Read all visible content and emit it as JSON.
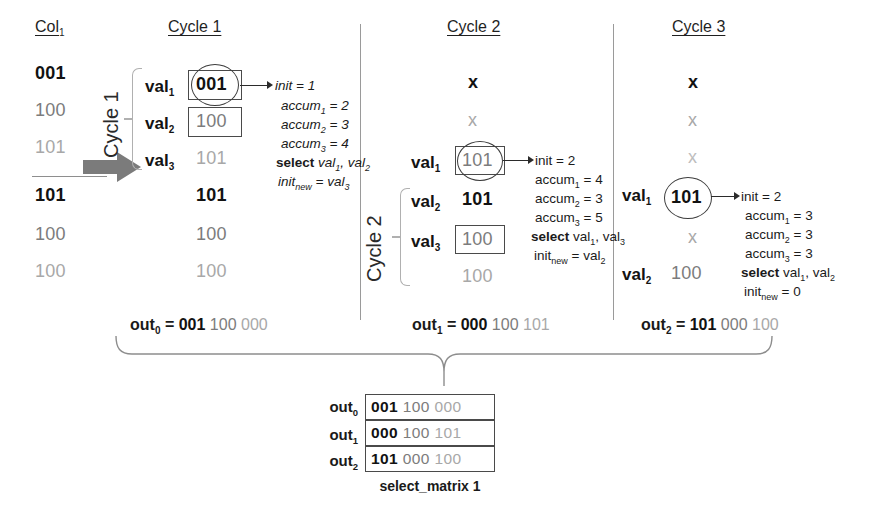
{
  "headers": {
    "col": "Col",
    "col_sub": "1",
    "cycle1": "Cycle 1",
    "cycle2": "Cycle 2",
    "cycle3": "Cycle 3"
  },
  "col1": {
    "values": [
      "001",
      "100",
      "101",
      "101",
      "100",
      "100"
    ],
    "arrow_label": "Cycle 1"
  },
  "cycle1": {
    "bracket_label": "Cycle 1",
    "rows": [
      {
        "label": "val",
        "sub": "1",
        "value": "001",
        "boxed": true,
        "circled": true
      },
      {
        "label": "val",
        "sub": "2",
        "value": "100",
        "boxed": true,
        "circled": false
      },
      {
        "label": "val",
        "sub": "3",
        "value": "101",
        "boxed": false,
        "circled": false
      }
    ],
    "tail": [
      "101",
      "100",
      "100"
    ],
    "annotations": {
      "init": "init = 1",
      "accum1": "accum",
      "accum1_sub": "1",
      "accum1_val": " = 2",
      "accum2": "accum",
      "accum2_sub": "2",
      "accum2_val": " = 3",
      "accum3": "accum",
      "accum3_sub": "3",
      "accum3_val": " = 4",
      "select_kw": "select",
      "select_args": "val",
      "select_sub1": "1",
      "select_mid": ", val",
      "select_sub2": "2",
      "initnew": "init",
      "initnew_sub": "new",
      "initnew_val": " = val",
      "initnew_valsub": "3"
    }
  },
  "cycle2": {
    "bracket_label": "Cycle 2",
    "top_marks": [
      "x",
      "x"
    ],
    "rows": [
      {
        "label": "val",
        "sub": "1",
        "value": "101",
        "boxed": true,
        "circled": true
      },
      {
        "label": "val",
        "sub": "2",
        "value": "101",
        "boxed": false,
        "circled": false
      },
      {
        "label": "val",
        "sub": "3",
        "value": "100",
        "boxed": true,
        "circled": false
      }
    ],
    "tail": [
      "100"
    ],
    "annotations": {
      "init": "init = 2",
      "accum1": "accum",
      "accum1_sub": "1",
      "accum1_val": " = 4",
      "accum2": "accum",
      "accum2_sub": "2",
      "accum2_val": " = 3",
      "accum3": "accum",
      "accum3_sub": "3",
      "accum3_val": " = 5",
      "select_kw": "select",
      "select_args": "val",
      "select_sub1": "1",
      "select_mid": ", val",
      "select_sub2": "3",
      "initnew": "init",
      "initnew_sub": "new",
      "initnew_val": " = val",
      "initnew_valsub": "2"
    }
  },
  "cycle3": {
    "top_marks": [
      "x",
      "x",
      "x"
    ],
    "rows": [
      {
        "label": "val",
        "sub": "1",
        "value": "101",
        "boxed": false,
        "circled": true
      }
    ],
    "mid_mark": "x",
    "row2": {
      "label": "val",
      "sub": "2",
      "value": "100"
    },
    "annotations": {
      "init": "init = 2",
      "accum1": "accum",
      "accum1_sub": "1",
      "accum1_val": " = 3",
      "accum2": "accum",
      "accum2_sub": "2",
      "accum2_val": " = 3",
      "accum3": "accum",
      "accum3_sub": "3",
      "accum3_val": " = 3",
      "select_kw": "select",
      "select_args": "val",
      "select_sub1": "1",
      "select_mid": ", val",
      "select_sub2": "2",
      "initnew": "init",
      "initnew_sub": "new",
      "initnew_val": " = 0"
    }
  },
  "outputs": [
    {
      "name": "out",
      "sub": "0",
      "eq": "=",
      "w1": "001",
      "w2": "100",
      "w3": "000"
    },
    {
      "name": "out",
      "sub": "1",
      "eq": "=",
      "w1": "000",
      "w2": "100",
      "w3": "101"
    },
    {
      "name": "out",
      "sub": "2",
      "eq": "=",
      "w1": "101",
      "w2": "000",
      "w3": "100"
    }
  ],
  "matrix": {
    "rows": [
      {
        "name": "out",
        "sub": "0",
        "w1": "001",
        "w2": "100",
        "w3": "000"
      },
      {
        "name": "out",
        "sub": "1",
        "w1": "000",
        "w2": "100",
        "w3": "101"
      },
      {
        "name": "out",
        "sub": "2",
        "w1": "101",
        "w2": "000",
        "w3": "100"
      }
    ],
    "caption": "select_matrix 1"
  },
  "colors": {
    "ink": "#121212",
    "gray1": "#7c7c7c",
    "gray2": "#a8a8a8",
    "gray3": "#bdbdbd",
    "arrow_fill": "#7b7b7b",
    "rule": "#9a9a9a"
  }
}
